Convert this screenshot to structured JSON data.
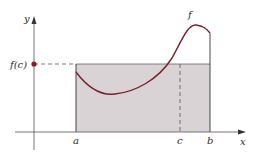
{
  "diagram": {
    "labels": {
      "y_axis": "y",
      "x_axis": "x",
      "function": "f",
      "fc": "f(c)",
      "a": "a",
      "b": "b",
      "c": "c"
    },
    "colors": {
      "curve": "#7a1f2b",
      "rectangle_fill": "#d9d3d6",
      "axis": "#555555",
      "dot": "#8b1a2a",
      "dashed": "#555555"
    }
  }
}
